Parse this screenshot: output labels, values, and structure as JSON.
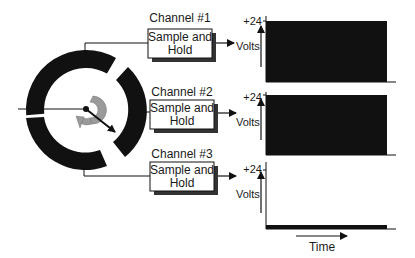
{
  "diagram": {
    "type": "multiplexer-sampling",
    "colors": {
      "ink": "#111111",
      "ring": "#111111",
      "rotor_arrow": "#999999",
      "signal_fill": "#111111",
      "box_shadow": "#333333",
      "background": "#ffffff"
    },
    "commutator": {
      "description": "Rotary commutator with three ring segments and a rotating contact arm",
      "rotation_icon": "curved-rotation-arrow"
    },
    "channels": [
      {
        "title": "Channel #1",
        "box_line1": "Sample and",
        "box_line2": "Hold",
        "chart": {
          "ymax_label": "+24",
          "ylabel": "Volts",
          "level": "high"
        }
      },
      {
        "title": "Channel #2",
        "box_line1": "Sample and",
        "box_line2": "Hold",
        "chart": {
          "ymax_label": "+24",
          "ylabel": "Volts",
          "level": "high"
        }
      },
      {
        "title": "Channel #3",
        "box_line1": "Sample and",
        "box_line2": "Hold",
        "chart": {
          "ymax_label": "+24",
          "ylabel": "Volts",
          "level": "low"
        }
      }
    ],
    "time_axis_label": "Time"
  }
}
